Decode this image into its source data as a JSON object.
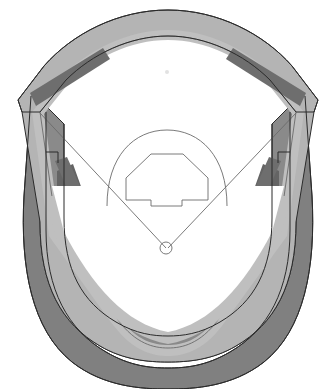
{
  "figure": {
    "name": "baseball-stadium-plan-diagram",
    "title": "Baseball stadium plan view",
    "width": 336,
    "height": 389,
    "background_color": "#ffffff"
  },
  "palette": {
    "background": "#ffffff",
    "field_surface": "#ffffff",
    "upper_deck_band": "#b4b4b4",
    "upper_deck_band_light": "#bfbfbf",
    "mid_deck_band": "#a8a8a8",
    "lower_bowl": "#8a8a8a",
    "outer_bowl": "#808080",
    "outer_bowl_dark": "#787878",
    "seating_block_dark": "#6e6e6e",
    "seating_block_darker": "#646464",
    "outline_stroke": "#2b2b2b",
    "field_line_stroke": "#6b6b6b"
  },
  "regions": [
    {
      "id": "outer-bowl",
      "label": "Outer seating bowl",
      "fill": "#808080"
    },
    {
      "id": "mid-bowl",
      "label": "Middle seating bowl",
      "fill": "#8a8a8a"
    },
    {
      "id": "upper-deck-band",
      "label": "Upper deck concourse band",
      "fill": "#b4b4b4"
    },
    {
      "id": "outfield-bleachers",
      "label": "Outfield bleacher arc",
      "fill": "#b4b4b4"
    },
    {
      "id": "playing-field",
      "label": "Playing field surface",
      "fill": "#ffffff"
    }
  ],
  "seating_blocks": [
    {
      "id": "block-left-field",
      "label": "Left field seating block",
      "fill": "#6e6e6e"
    },
    {
      "id": "block-right-field",
      "label": "Right field seating block",
      "fill": "#6e6e6e"
    },
    {
      "id": "block-third-base-upper",
      "label": "Third base upper seating block",
      "fill": "#6e6e6e"
    },
    {
      "id": "block-first-base-upper",
      "label": "First base upper seating block",
      "fill": "#6e6e6e"
    },
    {
      "id": "block-third-base-lower",
      "label": "Third base lower seating block",
      "fill": "#646464"
    },
    {
      "id": "block-first-base-lower",
      "label": "First base lower seating block",
      "fill": "#646464"
    }
  ],
  "field_features": [
    {
      "id": "infield-arc",
      "label": "Infield dirt arc"
    },
    {
      "id": "infield-diamond",
      "label": "Infield diamond"
    },
    {
      "id": "foul-line-left",
      "label": "Left field foul line"
    },
    {
      "id": "foul-line-right",
      "label": "Right field foul line"
    },
    {
      "id": "home-plate-circle",
      "label": "Home plate circle",
      "cx": 166,
      "cy": 248,
      "r": 6
    },
    {
      "id": "pitchers-mound-mark",
      "label": "Pitcher's mound mark",
      "cx": 167,
      "cy": 72,
      "r": 2
    }
  ],
  "geometry": {
    "home_plate_x": 166,
    "home_plate_y": 248,
    "center_field_y": 18,
    "bowl_bottom_y": 380
  }
}
